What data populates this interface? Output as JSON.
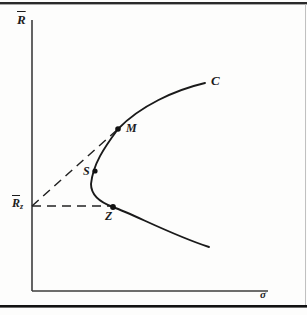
{
  "labels": {
    "y_axis": "R",
    "x_axis": "σ",
    "curve": "C",
    "point_m": "M",
    "point_s": "S",
    "point_z": "Z",
    "intercept_base": "R",
    "intercept_sub": "z"
  },
  "colors": {
    "background": "#fdfdfc",
    "ink": "#1c1c1c",
    "axis": "#3d3d3d",
    "frame_top": "#2a2a2a",
    "frame_bottom": "#121212",
    "page_edge": "#b9b9b9"
  },
  "geometry": {
    "frontier_path": "M 205 83 C 175 90 140 106 118 129 C 104 148 93 164 91 184 C 91 196 102 203 113 207 C 135 215 172 235 209 247",
    "y_axis_line": {
      "x1": "32",
      "y1": "20",
      "x2": "32",
      "y2": "291"
    },
    "x_axis_line": {
      "x1": "32",
      "y1": "291",
      "x2": "268",
      "y2": "291"
    },
    "tangent_dashed": {
      "x1": "32",
      "y1": "206",
      "x2": "118",
      "y2": "129"
    },
    "horizontal_dashed": {
      "x1": "32",
      "y1": "206",
      "x2": "112",
      "y2": "206"
    },
    "dot_m": {
      "cx": "118",
      "cy": "129",
      "r": "2.8"
    },
    "dot_s": {
      "cx": "95",
      "cy": "171",
      "r": "2.6"
    },
    "dot_z": {
      "cx": "113",
      "cy": "207",
      "r": "2.9"
    },
    "frame_top_rect": {
      "x": "0",
      "y": "2",
      "width": "307",
      "height": "2.4"
    },
    "frame_bottom_rect": {
      "x": "0",
      "y": "305",
      "width": "307",
      "height": "2.6"
    },
    "page_edge_rect": {
      "x": "305",
      "y": "4",
      "width": "0.9",
      "height": "301"
    }
  }
}
